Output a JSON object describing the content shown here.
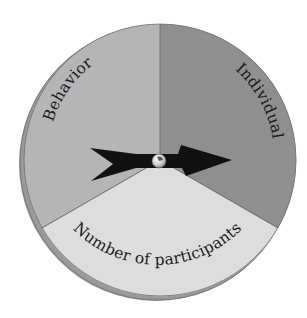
{
  "diagram": {
    "type": "spinner-wheel",
    "segments": [
      {
        "id": "behavior",
        "label": "Behavior",
        "color": "#b5b5b5"
      },
      {
        "id": "individual",
        "label": "Individual",
        "color": "#8f8f8f"
      },
      {
        "id": "participants",
        "label": "Number of participants",
        "color": "#dddddd"
      }
    ],
    "rim_color": "#9a9a9a",
    "edge_color": "#6e6e6e",
    "divider_color": "#555555",
    "arrow": {
      "color": "#111111",
      "points_to": "Individual"
    },
    "pin": {
      "color": "#cfcfcf"
    }
  }
}
